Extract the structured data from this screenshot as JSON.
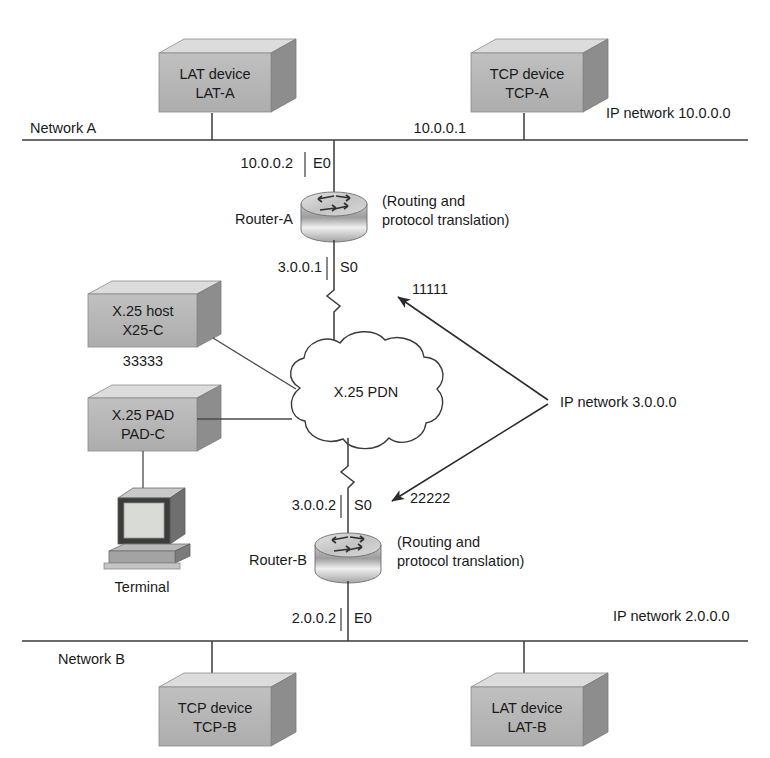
{
  "diagram": {
    "colors": {
      "box_front": "#b5b5b5",
      "box_top": "#d8d8d8",
      "box_side": "#8f8f8f",
      "router_body": "#b0b0b0",
      "router_top": "#dcdcdc",
      "line": "#3a3a3a",
      "text": "#1a1a1a",
      "cloud_fill": "#ffffff"
    },
    "networks": {
      "top_bus_label": "Network A",
      "top_bus_ip": "IP network 10.0.0.0",
      "bottom_bus_label": "Network B",
      "bottom_bus_ip": "IP network 2.0.0.0",
      "serial_ip": "IP network 3.0.0.0"
    },
    "nodes": [
      {
        "id": "lat-a",
        "line1": "LAT device",
        "line2": "LAT-A"
      },
      {
        "id": "tcp-a",
        "line1": "TCP device",
        "line2": "TCP-A"
      },
      {
        "id": "x25-host",
        "line1": "X.25 host",
        "line2": "X25-C",
        "sub": "33333"
      },
      {
        "id": "x25-pad",
        "line1": "X.25 PAD",
        "line2": "PAD-C"
      },
      {
        "id": "terminal",
        "line1": "Terminal"
      },
      {
        "id": "tcp-b",
        "line1": "TCP device",
        "line2": "TCP-B"
      },
      {
        "id": "lat-b",
        "line1": "LAT device",
        "line2": "LAT-B"
      }
    ],
    "routers": [
      {
        "id": "router-a",
        "name": "Router-A",
        "note_line1": "(Routing and",
        "note_line2": "protocol translation)",
        "eth_ip": "10.0.0.2",
        "eth_if": "E0",
        "ser_ip": "3.0.0.1",
        "ser_if": "S0"
      },
      {
        "id": "router-b",
        "name": "Router-B",
        "note_line1": "(Routing and",
        "note_line2": "protocol translation)",
        "eth_ip": "2.0.0.2",
        "eth_if": "E0",
        "ser_ip": "3.0.0.2",
        "ser_if": "S0"
      }
    ],
    "cloud": {
      "label": "X.25 PDN"
    },
    "addresses": {
      "tcp_a_ip": "10.0.0.1",
      "x25_a_addr": "11111",
      "x25_b_addr": "22222",
      "x25_host_addr": "33333"
    }
  }
}
